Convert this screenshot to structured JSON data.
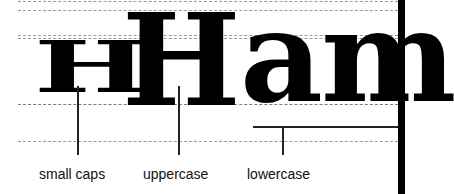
{
  "figure": {
    "glyphs": {
      "small_caps": "H",
      "uppercase": "H",
      "lowercase": "am"
    },
    "labels": {
      "small_caps": "small caps",
      "uppercase": "uppercase",
      "lowercase": "lowercase"
    },
    "guides": [
      "ascender line",
      "cap height",
      "x-height",
      "baseline",
      "descender line"
    ],
    "colors": {
      "ink": "#000000",
      "guide": "#9a9a9a",
      "background": "#ffffff"
    }
  }
}
